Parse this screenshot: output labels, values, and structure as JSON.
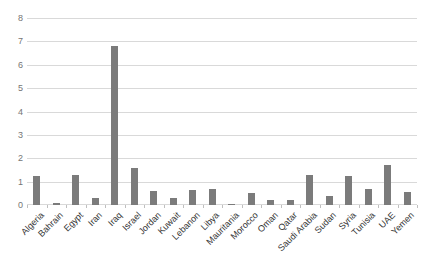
{
  "chart_data": {
    "type": "bar",
    "title": "",
    "xlabel": "",
    "ylabel": "",
    "categories": [
      "Algeria",
      "Bahrain",
      "Egypt",
      "Iran",
      "Iraq",
      "Israel",
      "Jordan",
      "Kuwait",
      "Lebanon",
      "Libya",
      "Mauritania",
      "Morocco",
      "Oman",
      "Qatar",
      "Saudi Arabia",
      "Sudan",
      "Syria",
      "Tunisia",
      "UAE",
      "Yemen"
    ],
    "values": [
      1.25,
      0.1,
      1.3,
      0.3,
      6.8,
      1.6,
      0.6,
      0.3,
      0.65,
      0.7,
      0.05,
      0.5,
      0.2,
      0.2,
      1.3,
      0.4,
      1.25,
      0.7,
      1.7,
      0.55
    ],
    "ylim": [
      0,
      8
    ],
    "ytick_step": 1,
    "ytick_labels": [
      "0",
      "1",
      "2",
      "3",
      "4",
      "5",
      "6",
      "7",
      "8"
    ],
    "grid": true,
    "legend": false,
    "colors": {
      "bar": "#7b7b7b",
      "gridline": "#d9d9d9",
      "axis_tick": "#bfbfbf",
      "y_label": "#757575",
      "x_label": "#333333",
      "background": "#ffffff"
    }
  }
}
